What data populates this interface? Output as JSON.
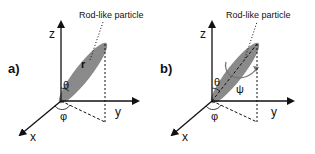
{
  "panels": [
    {
      "label": "a)",
      "particle_label": "Rod-like particle",
      "axes": {
        "z": "z",
        "y": "y",
        "x": "x"
      },
      "angles": {
        "theta": "θ",
        "phi": "φ"
      },
      "vector_label": "r"
    },
    {
      "label": "b)",
      "particle_label": "Rod-like particle",
      "axes": {
        "z": "z",
        "y": "y",
        "x": "x"
      },
      "angles": {
        "theta": "θ",
        "phi": "φ",
        "psi": "ψ"
      }
    }
  ],
  "colors": {
    "particle": "#8a8a8a",
    "lines": "#111111",
    "background": "#ffffff"
  }
}
